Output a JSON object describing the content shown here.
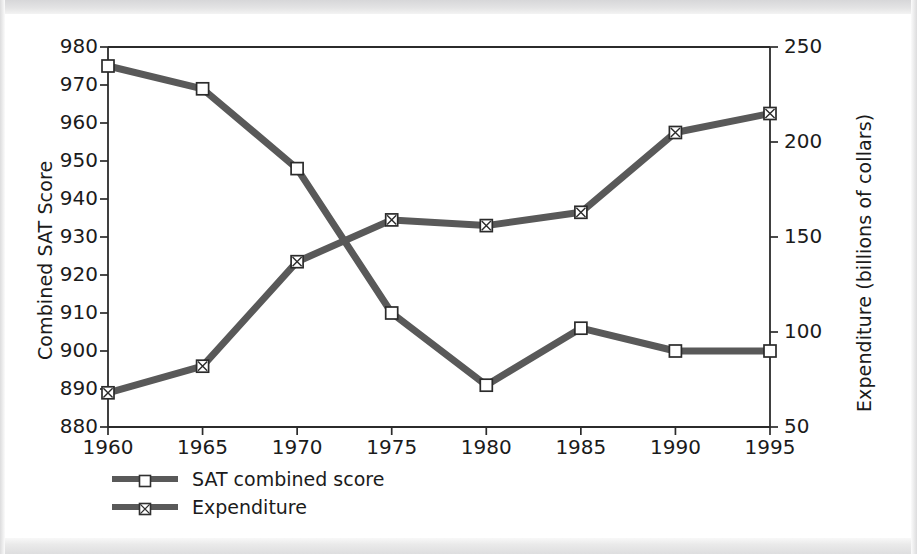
{
  "chart_data": {
    "type": "line",
    "title": "",
    "subtitle": "",
    "xlabel": "",
    "ylabel": "Combined SAT Score",
    "ylabel_right": "Expenditure (billions of collars)",
    "x": [
      1960,
      1965,
      1970,
      1975,
      1980,
      1985,
      1990,
      1995
    ],
    "xtick_labels": [
      "1960",
      "1965",
      "1970",
      "1975",
      "1980",
      "1985",
      "1990",
      "1995"
    ],
    "xlim": [
      1960,
      1995
    ],
    "ylim": [
      880,
      980
    ],
    "ytick_labels": [
      "980",
      "970",
      "960",
      "950",
      "940",
      "930",
      "920",
      "910",
      "900",
      "890",
      "880"
    ],
    "ytick_values": [
      980,
      970,
      960,
      950,
      940,
      930,
      920,
      910,
      900,
      890,
      880
    ],
    "ylim_right": [
      50,
      250
    ],
    "ytick_labels_right": [
      "250",
      "200",
      "150",
      "100",
      "50"
    ],
    "ytick_values_right": [
      250,
      200,
      150,
      100,
      50
    ],
    "grid": false,
    "legend_position": "below-axes-left",
    "series": [
      {
        "name": "SAT combined score",
        "axis": "left",
        "marker": "open-square",
        "color": "#595959",
        "values": [
          975,
          969,
          948,
          910,
          891,
          906,
          900,
          900
        ]
      },
      {
        "name": "Expenditure",
        "axis": "right",
        "marker": "crossed-square",
        "color": "#595959",
        "values": [
          68,
          82,
          137,
          159,
          156,
          163,
          205,
          215
        ]
      }
    ],
    "annotations": []
  },
  "legend": {
    "items": [
      {
        "label": "SAT combined score",
        "marker": "open-square-icon"
      },
      {
        "label": "Expenditure",
        "marker": "crossed-square-icon"
      }
    ]
  },
  "colors": {
    "line": "#595959",
    "axis": "#2b2b2b",
    "text": "#1b1b1b",
    "marker_fill": "#ffffff",
    "background": "#ffffff"
  }
}
